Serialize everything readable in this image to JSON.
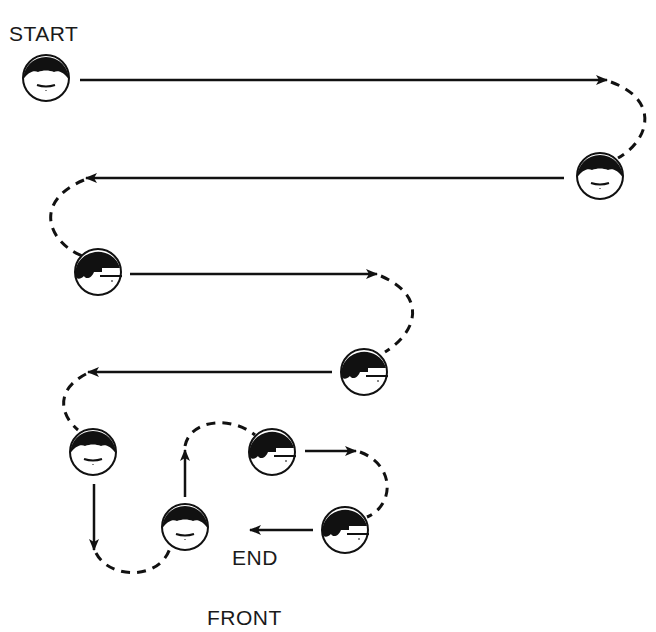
{
  "diagram": {
    "labels": {
      "start": "START",
      "end": "END",
      "front": "FRONT"
    },
    "colors": {
      "ink": "#111111",
      "background": "#ffffff"
    },
    "positions": [
      {
        "id": 1,
        "x": 46,
        "y": 78,
        "facing": "front"
      },
      {
        "id": 2,
        "x": 600,
        "y": 176,
        "facing": "front"
      },
      {
        "id": 3,
        "x": 98,
        "y": 272,
        "facing": "right"
      },
      {
        "id": 4,
        "x": 364,
        "y": 372,
        "facing": "right"
      },
      {
        "id": 5,
        "x": 93,
        "y": 452,
        "facing": "front"
      },
      {
        "id": 6,
        "x": 185,
        "y": 527,
        "facing": "front"
      },
      {
        "id": 7,
        "x": 272,
        "y": 452,
        "facing": "right"
      },
      {
        "id": 8,
        "x": 345,
        "y": 530,
        "facing": "right"
      }
    ]
  }
}
